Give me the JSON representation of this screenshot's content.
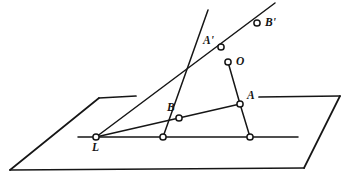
{
  "figure": {
    "type": "geometric-diagram",
    "canvas": {
      "width": 348,
      "height": 179
    },
    "style": {
      "stroke_color": "#161616",
      "background_color": "#ffffff",
      "node_fill_color": "#ffffff",
      "line_width": 1.6,
      "node_radius": 3.1
    },
    "points": [
      {
        "id": "L",
        "label": "L",
        "x": 96,
        "y": 137,
        "marker": true,
        "label_dx": -4,
        "label_dy": 7
      },
      {
        "id": "B",
        "label": "B",
        "x": 179,
        "y": 118,
        "marker": true,
        "label_dx": -12,
        "label_dy": -14
      },
      {
        "id": "A",
        "label": "A",
        "x": 240,
        "y": 104,
        "marker": true,
        "label_dx": 7,
        "label_dy": -12
      },
      {
        "id": "O",
        "label": "O",
        "x": 228,
        "y": 62,
        "marker": true,
        "label_dx": 8,
        "label_dy": -4
      },
      {
        "id": "Aprime",
        "label": "A'",
        "x": 221,
        "y": 47,
        "marker": true,
        "label_dx": -17,
        "label_dy": -10
      },
      {
        "id": "Bprime",
        "label": "B'",
        "x": 257,
        "y": 23,
        "marker": true,
        "label_dx": 8,
        "label_dy": -3
      },
      {
        "id": "b0",
        "label": "",
        "x": 163,
        "y": 137,
        "marker": true,
        "label_dx": 0,
        "label_dy": 0
      },
      {
        "id": "a0",
        "label": "",
        "x": 250,
        "y": 137,
        "marker": true,
        "label_dx": 0,
        "label_dy": 0
      }
    ],
    "plane": {
      "name": "reference-plane",
      "edges": [
        {
          "name": "plane-edge-top-left",
          "x1": 99,
          "y1": 98,
          "x2": 136,
          "y2": 96
        },
        {
          "name": "plane-edge-top-right",
          "x1": 259,
          "y1": 97,
          "x2": 340,
          "y2": 96
        },
        {
          "name": "plane-edge-left",
          "x1": 99,
          "y1": 98,
          "x2": 10,
          "y2": 170
        },
        {
          "name": "plane-edge-bottom",
          "x1": 10,
          "y1": 170,
          "x2": 304,
          "y2": 168
        },
        {
          "name": "plane-edge-right",
          "x1": 304,
          "y1": 168,
          "x2": 340,
          "y2": 96
        }
      ]
    },
    "lines": [
      {
        "name": "intersection-line",
        "x1": 78,
        "y1": 137,
        "x2": 298,
        "y2": 137
      },
      {
        "name": "ray-L-to-Bprime",
        "x1": 96,
        "y1": 137,
        "x2": 275,
        "y2": 3
      },
      {
        "name": "ray-L-to-A",
        "x1": 96,
        "y1": 137,
        "x2": 240,
        "y2": 104
      },
      {
        "name": "line-through-Aprime-B",
        "x1": 208,
        "y1": 10,
        "x2": 163,
        "y2": 137
      },
      {
        "name": "segment-O-to-a0",
        "x1": 228,
        "y1": 62,
        "x2": 250,
        "y2": 137
      },
      {
        "name": "segment-A-to-a0-join",
        "x1": 240,
        "y1": 104,
        "x2": 250,
        "y2": 137
      }
    ],
    "labels": {
      "L": "L",
      "B": "B",
      "A": "A",
      "O": "O",
      "Aprime": "A'",
      "Bprime": "B'"
    }
  }
}
